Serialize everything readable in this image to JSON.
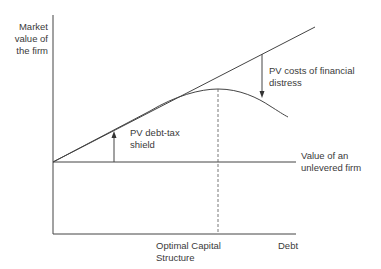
{
  "diagram": {
    "y_axis_label": [
      "Market",
      "value of",
      "the firm"
    ],
    "x_axis_label": "Debt",
    "optimal_label": [
      "Optimal Capital",
      "Structure"
    ],
    "distress_label": [
      "PV costs of financial",
      "distress"
    ],
    "tax_shield_label": [
      "PV debt-tax",
      "shield"
    ],
    "unlevered_label": [
      "Value of an",
      "unlevered firm"
    ],
    "colors": {
      "line": "#444444",
      "text": "#3a3a3a"
    }
  }
}
